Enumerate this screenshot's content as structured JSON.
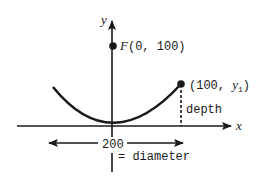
{
  "diagram": {
    "axes": {
      "x_label": "x",
      "y_label": "y"
    },
    "focus": {
      "name": "F",
      "coords": "(0, 100)"
    },
    "point": {
      "open": "(100, ",
      "var": "y",
      "sub": "1",
      "close": ")"
    },
    "depth_label": "depth",
    "width_label": "200",
    "diameter_label": "= diameter",
    "colors": {
      "ink": "#1a1a1a",
      "background": "#ffffff"
    }
  }
}
